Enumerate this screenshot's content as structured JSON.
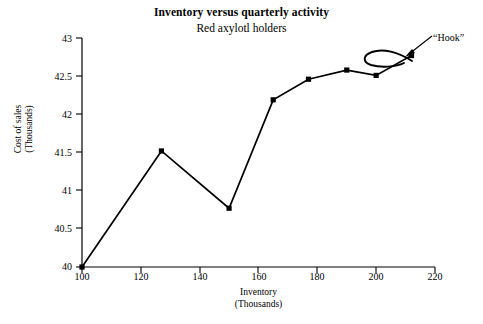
{
  "chart_data": {
    "type": "line",
    "title": "Inventory versus quarterly activity",
    "subtitle": "Red axylotl holders",
    "xlabel_line1": "Inventory",
    "xlabel_line2": "(Thousands)",
    "ylabel_line1": "Cost of sales",
    "ylabel_line2": "(Thousands)",
    "xlim": [
      100,
      220
    ],
    "ylim": [
      40,
      43
    ],
    "grid": false,
    "legend": "none",
    "line_color": "#000000",
    "marker": "square",
    "marker_color": "#000000",
    "xticks": [
      "100",
      "120",
      "140",
      "160",
      "180",
      "200",
      "220"
    ],
    "yticks": [
      "40",
      "40.5",
      "41",
      "41.5",
      "42",
      "42.5",
      "43"
    ],
    "xtick_values": [
      100,
      120,
      140,
      160,
      180,
      200,
      220
    ],
    "ytick_values": [
      40,
      40.5,
      41,
      41.5,
      42,
      42.5,
      43
    ],
    "x": [
      100,
      127,
      150,
      165,
      177,
      190,
      200,
      212
    ],
    "values": [
      40.0,
      41.52,
      40.77,
      42.19,
      42.46,
      42.58,
      42.51,
      42.77
    ],
    "annotations": [
      {
        "text": "“Hook”",
        "x": 218,
        "y": 42.95,
        "points_to_x": 210,
        "points_to_y": 42.8
      }
    ]
  }
}
